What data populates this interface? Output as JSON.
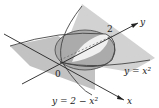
{
  "diagram": {
    "type": "3d-surface-intersection",
    "surfaces": [
      {
        "name": "parabolic-cylinder-1",
        "equation": "y = x^2",
        "label": "y = x²"
      },
      {
        "name": "parabolic-cylinder-2",
        "equation": "y = 2 − x^2",
        "label": "y = 2 − x²"
      }
    ],
    "axes": {
      "x_label": "x",
      "y_label": "y",
      "origin_label": "0",
      "y_tick_label": "2"
    },
    "colors": {
      "surface_dark": "#a9a9a9",
      "surface_light": "#cfcfcf",
      "region_highlight": "#f2f2f2",
      "lines": "#333333"
    }
  }
}
